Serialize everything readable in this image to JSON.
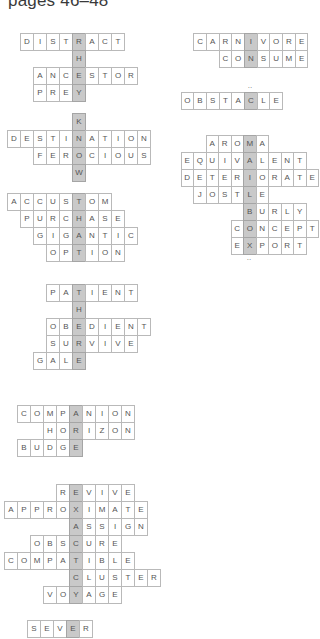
{
  "page": {
    "title": "pages 46–48"
  },
  "colors": {
    "cell_border": "#b9b9b9",
    "highlight": "#c9c9c9",
    "text": "#555555"
  },
  "puzzles": [
    {
      "id": "they",
      "hidden_word": "THEY",
      "rows": [
        {
          "word": "DISTRACT",
          "key_index": 4
        },
        {
          "word": "H",
          "key_index": 0
        },
        {
          "word": "ANCESTOR",
          "key_index": 3
        },
        {
          "word": "PREY",
          "key_index": 3
        }
      ]
    },
    {
      "id": "know",
      "hidden_word": "KNOW",
      "rows": [
        {
          "word": "K",
          "key_index": 0
        },
        {
          "word": "DESTINATION",
          "key_index": 5
        },
        {
          "word": "FEROCIOUS",
          "key_index": 3
        },
        {
          "word": "W",
          "key_index": 0
        }
      ]
    },
    {
      "id": "that",
      "hidden_word": "THAT",
      "rows": [
        {
          "word": "ACCUSTOM",
          "key_index": 5
        },
        {
          "word": "PURCHASE",
          "key_index": 4
        },
        {
          "word": "GIGANTIC",
          "key_index": 3
        },
        {
          "word": "OPTION",
          "key_index": 2
        }
      ]
    },
    {
      "id": "there",
      "hidden_word": "THERE",
      "rows": [
        {
          "word": "PATIENT",
          "key_index": 2
        },
        {
          "word": "H",
          "key_index": 0
        },
        {
          "word": "OBEDIENT",
          "key_index": 2
        },
        {
          "word": "SURVIVE",
          "key_index": 2
        },
        {
          "word": "GALE",
          "key_index": 3
        }
      ]
    },
    {
      "id": "are",
      "hidden_word": "ARE",
      "rows": [
        {
          "word": "COMPANION",
          "key_index": 4
        },
        {
          "word": "HORIZON",
          "key_index": 2
        },
        {
          "word": "BUDGE",
          "key_index": 4
        }
      ]
    },
    {
      "id": "exactly",
      "hidden_word": "EXACTLY",
      "rows": [
        {
          "word": "REVIVE",
          "key_index": 1
        },
        {
          "word": "APPROXIMATE",
          "key_index": 5
        },
        {
          "word": "ASSIGN",
          "key_index": 0
        },
        {
          "word": "OBSCURE",
          "key_index": 3
        },
        {
          "word": "COMPATIBLE",
          "key_index": 5
        },
        {
          "word": "CLUSTER",
          "key_index": 0
        },
        {
          "word": "VOYAGE",
          "key_index": 2
        }
      ]
    },
    {
      "id": "sever",
      "hidden_word": "E",
      "rows": [
        {
          "word": "SEVER",
          "key_index": 3
        }
      ]
    },
    {
      "id": "in",
      "hidden_word": "IN",
      "rows": [
        {
          "word": "CARNIVORE",
          "key_index": 4
        },
        {
          "word": "CONSUME",
          "key_index": 2
        }
      ]
    },
    {
      "id": "a",
      "hidden_word": "A",
      "rows": [
        {
          "word": "OBSTACLE",
          "key_index": 5,
          "mark_above": "··"
        }
      ]
    },
    {
      "id": "mailbox",
      "hidden_word": "MAILBOX",
      "rows": [
        {
          "word": "AROMA",
          "key_index": 3
        },
        {
          "word": "EQUIVALENT",
          "key_index": 5
        },
        {
          "word": "DETERIORATE",
          "key_index": 5
        },
        {
          "word": "JOSTLE",
          "key_index": 4
        },
        {
          "word": "BURLY",
          "key_index": 0
        },
        {
          "word": "CONCEPT",
          "key_index": 1
        },
        {
          "word": "EXPORT",
          "key_index": 1,
          "mark_below": "··"
        }
      ]
    }
  ]
}
